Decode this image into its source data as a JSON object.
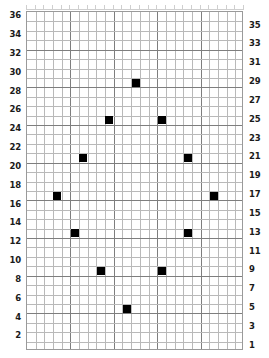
{
  "chart_data": {
    "type": "scatter",
    "title": "",
    "subtitle": "",
    "xlabel": "",
    "ylabel": "",
    "grid": true,
    "legend_position": "none",
    "marker_shape": "square",
    "marker_color": "#000000",
    "grid_columns": 25,
    "grid_rows": 36,
    "xlim": [
      0,
      25
    ],
    "ylim": [
      0,
      36
    ],
    "x_tick_labels": [],
    "left_axis": {
      "position": "left",
      "description": "even row numbers, top to bottom",
      "tick_labels": [
        "36",
        "34",
        "32",
        "30",
        "28",
        "26",
        "24",
        "22",
        "20",
        "18",
        "16",
        "14",
        "12",
        "10",
        "8",
        "6",
        "4",
        "2"
      ],
      "tick_values": [
        36,
        34,
        32,
        30,
        28,
        26,
        24,
        22,
        20,
        18,
        16,
        14,
        12,
        10,
        8,
        6,
        4,
        2
      ]
    },
    "right_axis": {
      "position": "right",
      "description": "odd row numbers, top to bottom",
      "tick_labels": [
        "35",
        "33",
        "31",
        "29",
        "27",
        "25",
        "23",
        "21",
        "19",
        "17",
        "15",
        "13",
        "11",
        "9",
        "7",
        "5",
        "3",
        "1"
      ],
      "tick_values": [
        35,
        33,
        31,
        29,
        27,
        25,
        23,
        21,
        19,
        17,
        15,
        13,
        11,
        9,
        7,
        5,
        3,
        1
      ]
    },
    "points": [
      {
        "col": 13,
        "row": 29
      },
      {
        "col": 10,
        "row": 25
      },
      {
        "col": 16,
        "row": 25
      },
      {
        "col": 7,
        "row": 21
      },
      {
        "col": 19,
        "row": 21
      },
      {
        "col": 4,
        "row": 17
      },
      {
        "col": 22,
        "row": 17
      },
      {
        "col": 6,
        "row": 13
      },
      {
        "col": 19,
        "row": 13
      },
      {
        "col": 9,
        "row": 9
      },
      {
        "col": 16,
        "row": 9
      },
      {
        "col": 12,
        "row": 5
      }
    ],
    "x": [
      13,
      10,
      16,
      7,
      19,
      4,
      22,
      6,
      19,
      9,
      16,
      12
    ],
    "values": [
      29,
      25,
      25,
      21,
      21,
      17,
      17,
      13,
      13,
      9,
      9,
      5
    ]
  },
  "colors": {
    "marker": "#000000",
    "gridline_minor": "#b9b9b9",
    "gridline_major": "#7e7e7e",
    "plot_border": "#9a9a9a",
    "label_text": "#1a1a1a",
    "background": "#ffffff"
  }
}
